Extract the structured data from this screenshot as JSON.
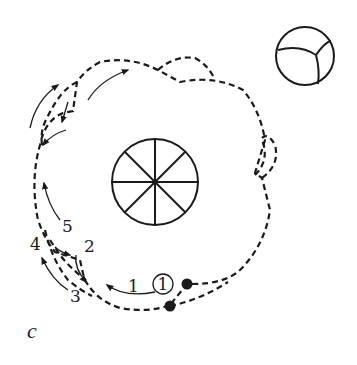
{
  "figure": {
    "panel_label": "c",
    "labels": {
      "step_1": "1",
      "step_2": "2",
      "step_3": "3",
      "step_4": "4",
      "step_5": "5",
      "circled_1": "1"
    },
    "elements": {
      "central_body": "wheel-with-8-spokes",
      "outer_body": "segmented-sphere",
      "markers": [
        "start-dot",
        "end-dot"
      ]
    },
    "colors": {
      "stroke": "#1a1a1a",
      "background": "#ffffff"
    }
  }
}
